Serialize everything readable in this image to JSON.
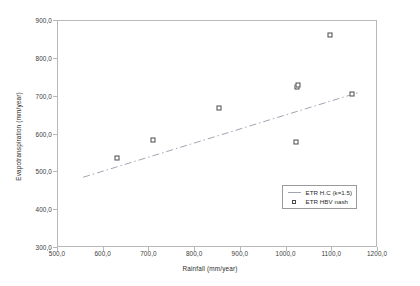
{
  "chart_data": {
    "type": "scatter",
    "title": "",
    "xlabel": "Rainfall (mm/year)",
    "ylabel": "Evapotranspiration (mm/year)",
    "xlim": [
      500.0,
      1200.0
    ],
    "ylim": [
      300.0,
      900.0
    ],
    "xticks": [
      "500,0",
      "600,0",
      "700,0",
      "800,0",
      "900,0",
      "1000,0",
      "1100,0",
      "1200,0"
    ],
    "xtick_values": [
      500,
      600,
      700,
      800,
      900,
      1000,
      1100,
      1200
    ],
    "yticks": [
      "300,0",
      "400,0",
      "500,0",
      "600,0",
      "700,0",
      "800,0",
      "900,0"
    ],
    "ytick_values": [
      300,
      400,
      500,
      600,
      700,
      800,
      900
    ],
    "grid": false,
    "legend_position": "bottom-right",
    "series": [
      {
        "name": "ETR H.C (k=1.5)",
        "type": "line",
        "style": "dash-dot",
        "color": "#9fa6b2",
        "x": [
          555,
          1160
        ],
        "y": [
          487,
          712
        ]
      },
      {
        "name": "ETR HBV nash",
        "type": "scatter",
        "marker": "open-square",
        "color": "#4a4a4a",
        "points": [
          {
            "x": 628,
            "y": 537
          },
          {
            "x": 707,
            "y": 585
          },
          {
            "x": 853,
            "y": 670
          },
          {
            "x": 1020,
            "y": 580
          },
          {
            "x": 1022,
            "y": 726
          },
          {
            "x": 1024,
            "y": 730
          },
          {
            "x": 1095,
            "y": 864
          },
          {
            "x": 1143,
            "y": 707
          }
        ]
      }
    ]
  },
  "legend": {
    "entries": [
      {
        "label": "ETR H.C (k=1.5)",
        "key": "line-key"
      },
      {
        "label": "ETR HBV nash",
        "key": "square-marker-key"
      }
    ]
  }
}
